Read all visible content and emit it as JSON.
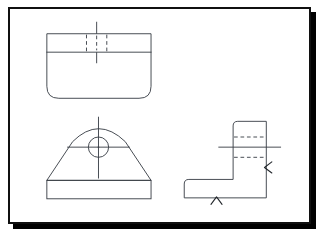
{
  "document": {
    "kind": "engineering-drawing",
    "title": "",
    "sheet": {
      "background_color": "#ffffff",
      "frame_color": "#101010",
      "shadow_color": "#000000",
      "frame_x": 8,
      "frame_y": 7,
      "frame_width": 303,
      "frame_height": 217,
      "frame_border_width": 2
    },
    "line_styles": {
      "visible_color": "#3a3f46",
      "hidden_color": "#3a3f46",
      "center_color": "#3a3f46",
      "mark_color": "#23272c",
      "hidden_dash": "4 3",
      "visible_width": 1
    }
  },
  "views": [
    {
      "name": "top-view",
      "label": "",
      "description": "rounded rectangle plan with upper division band, hidden slot edges and vertical centerline",
      "outline": {
        "x": 40,
        "y": 29,
        "width": 113,
        "height": 70,
        "corner_radius_top": 0,
        "corner_radius_bottom": 13
      },
      "division_line_y": 49,
      "hidden_lines": [
        {
          "x": 83,
          "y1": 30,
          "y2": 49
        },
        {
          "x": 105,
          "y1": 30,
          "y2": 49
        },
        {
          "x": 94,
          "y1": 31,
          "y2": 48
        }
      ],
      "center_line": {
        "x": 94,
        "y1": 16,
        "y2": 61
      }
    },
    {
      "name": "front-view",
      "label": "",
      "description": "trapezoid with arched top, central through hole with crosshair centerlines, rectangular base plate",
      "base": {
        "x": 40,
        "y": 188,
        "width": 113,
        "height": 20
      },
      "body": {
        "left_bottom_x": 40,
        "right_bottom_x": 153,
        "bottom_y": 188,
        "arc_left_x": 68,
        "arc_right_x": 125,
        "arc_top_y": 124,
        "apex_x": 96
      },
      "hole": {
        "cx": 96,
        "cy": 152,
        "r": 11
      },
      "center_lines": {
        "horizontal": {
          "x1": 62,
          "x2": 130,
          "y": 152
        },
        "vertical": {
          "y1": 119,
          "y2": 186,
          "x": 96
        }
      },
      "center_dot": {
        "cx": 96,
        "cy": 152,
        "r": 0.9
      }
    },
    {
      "name": "side-view",
      "label": "",
      "description": "L-shaped right side elevation with hidden hole lines, horizontal centerline and two machining arrow marks",
      "outline_points": "189,187 189,207 278,207 278,124 242,124 242,187",
      "base": {
        "x": 189,
        "y": 187,
        "width": 89,
        "height": 20
      },
      "vertical_member": {
        "x": 242,
        "y": 124,
        "width": 36,
        "height": 63,
        "corner_radius_top_left": 5
      },
      "corner_radius_base_top_left": 5,
      "hidden_lines": [
        {
          "x1": 243,
          "x2": 277,
          "y": 141
        },
        {
          "x1": 243,
          "x2": 277,
          "y": 163
        }
      ],
      "center_line": {
        "x1": 226,
        "x2": 294,
        "y": 152
      },
      "marks": [
        {
          "name": "surface-mark-right",
          "type": "arrowhead-left",
          "x": 278,
          "y": 174
        },
        {
          "name": "surface-mark-bottom",
          "type": "arrowhead-up",
          "x": 224,
          "y": 207
        }
      ]
    }
  ]
}
